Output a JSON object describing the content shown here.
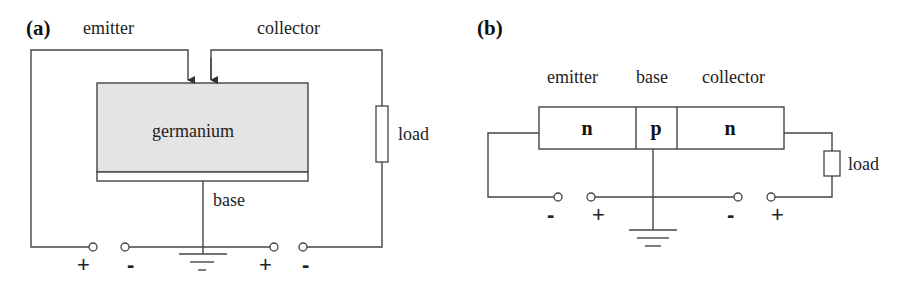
{
  "panel_a": {
    "label": "(a)",
    "emitter_label": "emitter",
    "collector_label": "collector",
    "block_label": "germanium",
    "base_label": "base",
    "load_label": "load",
    "terminal_signs": [
      "+",
      "-",
      "+",
      "-"
    ],
    "block_fill": "#e6e6e6"
  },
  "panel_b": {
    "label": "(b)",
    "emitter_label": "emitter",
    "base_label": "base",
    "collector_label": "collector",
    "regions": [
      "n",
      "p",
      "n"
    ],
    "load_label": "load",
    "terminal_signs": [
      "-",
      "+",
      "-",
      "+"
    ]
  }
}
